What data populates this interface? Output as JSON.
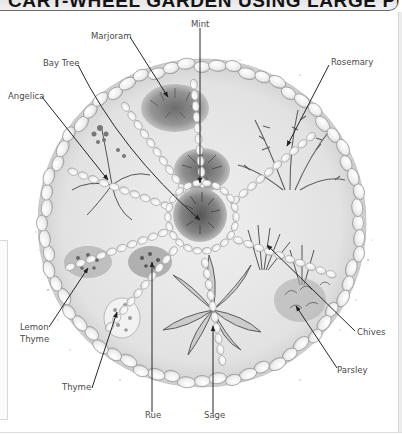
{
  "header": {
    "title": "CART-WHEEL GARDEN USING LARGE PEBBLES"
  },
  "diagram": {
    "type": "labelled-illustration",
    "labels": [
      {
        "id": "mint",
        "text": "Mint"
      },
      {
        "id": "marjoram",
        "text": "Marjoram"
      },
      {
        "id": "bay-tree",
        "text": "Bay Tree"
      },
      {
        "id": "rosemary",
        "text": "Rosemary"
      },
      {
        "id": "angelica",
        "text": "Angelica"
      },
      {
        "id": "lemon-thyme-1",
        "text": "Lemon"
      },
      {
        "id": "lemon-thyme-2",
        "text": "Thyme"
      },
      {
        "id": "thyme",
        "text": "Thyme"
      },
      {
        "id": "rue",
        "text": "Rue"
      },
      {
        "id": "sage",
        "text": "Sage"
      },
      {
        "id": "chives",
        "text": "Chives"
      },
      {
        "id": "parsley",
        "text": "Parsley"
      }
    ]
  },
  "colors": {
    "ink": "#2a2a2a",
    "label": "#4a4a4a",
    "pebble_fill": "#f7f7f7",
    "pebble_stroke": "#9a9a9a",
    "soil": "#e9e9e9",
    "foliage_dark": "#5a5a5a",
    "foliage_mid": "#8c8c8c"
  }
}
